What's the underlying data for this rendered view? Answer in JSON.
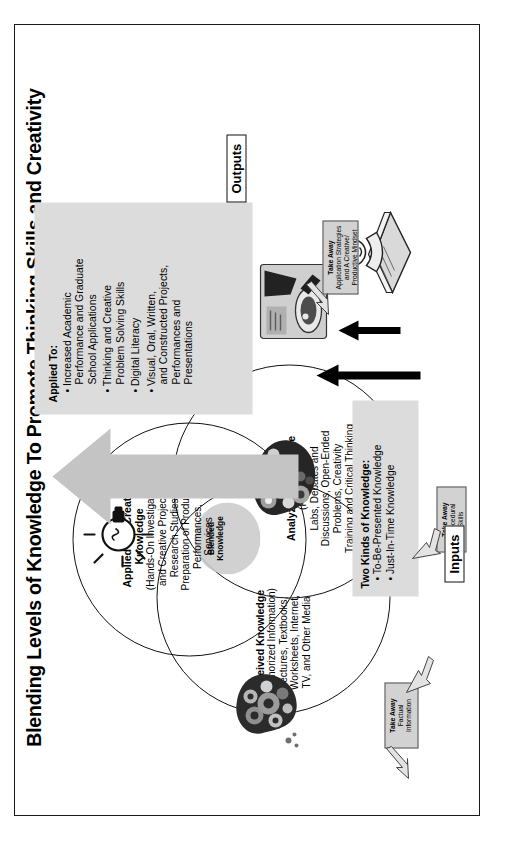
{
  "figure": {
    "caption": "Figure 3. Theory of Blended Knowledge: Received, Analyzed, and Applied and Created Knowledge.",
    "title": "Blending Levels of Knowledge To Promote Thinking Skills and Creativity"
  },
  "sections": {
    "inputs_label": "Inputs",
    "outputs_label": "Outputs"
  },
  "venn": {
    "received": {
      "title": "Received Knowledge",
      "subtitle": "(Memorized Information)",
      "detail": "Lectures, Textbooks,\nWorksheets, Internet,\nTV, and Other Media"
    },
    "analyzed": {
      "title": "Analyzed Knowledge",
      "subtitle": "(Process)",
      "detail": "Labs, Debates and\nDiscussions, Open-Ended\nProblems, Creativity\nTraining and Critical Thinking\nExercises"
    },
    "applied": {
      "title": "Applied and Created\nKnowledge",
      "subtitle": "(Hands-On Investigative\nand Creative Projects)",
      "detail": "Research Studies,\nPreparation of Products,\nPerformances,\nServices"
    },
    "blended_label": "Blended\nKnowledge"
  },
  "applied_to_box": {
    "title": "Applied To:",
    "items": [
      "Increased Academic\nPerformance and Graduate\nSchool Applications",
      "Thinking and Creative\nProblem Solving Skills",
      "Digital Literacy",
      "Visual, Oral, Written,\nand Constructed Projects,\nPerformances and\nPresentations"
    ]
  },
  "two_kinds_box": {
    "title": "Two Kinds of Knowledge:",
    "items": [
      "To-Be-Presented Knowledge",
      "Just-In-Time Knowledge"
    ]
  },
  "takeaways": [
    {
      "name": "factual",
      "title": "Take Away",
      "body": "Factual\nInformation"
    },
    {
      "name": "procedural",
      "title": "Take Away",
      "body": "Procedural\nSkills"
    },
    {
      "name": "application",
      "title": "Take Away",
      "body": "Application Strategies\nand A Creative/\nProductive Mindset"
    }
  ],
  "icons": {
    "gear_head": "gear-head-icon",
    "circles_head": "circles-head-icon",
    "lightbulb": "lightbulb-icon",
    "student_reading": "student-reading-icon",
    "lab_work": "lab-work-icon",
    "big_up_arrow": "big-up-arrow-icon"
  },
  "colors": {
    "box_fill": "#dcdcdc",
    "arrow_fill": "#c4c4c4",
    "blend_fill": "#c9c9c9",
    "outline": "#111111"
  }
}
